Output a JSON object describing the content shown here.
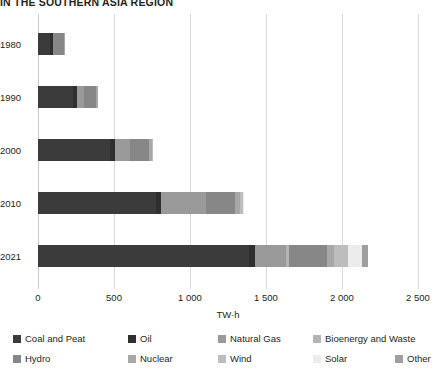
{
  "title": "IN THE SOUTHERN ASIA REGION",
  "axis": {
    "xlabel": "TW·h",
    "xticks": [
      "0",
      "500",
      "1 000",
      "1 500",
      "2 000",
      "2 500"
    ],
    "xlim": [
      0,
      2500
    ],
    "grid": true
  },
  "legend": {
    "position": "bottom",
    "entries": [
      {
        "label": "Coal and Peat",
        "color": "#3b3b3b"
      },
      {
        "label": "Oil",
        "color": "#2f2f2f"
      },
      {
        "label": "Natural Gas",
        "color": "#9a9a9a"
      },
      {
        "label": "Bioenergy and Waste",
        "color": "#b4b4b4"
      },
      {
        "label": "Hydro",
        "color": "#878787"
      },
      {
        "label": "Nuclear",
        "color": "#a8a8a8"
      },
      {
        "label": "Wind",
        "color": "#bdbdbd"
      },
      {
        "label": "Solar",
        "color": "#ececec"
      },
      {
        "label": "Other",
        "color": "#9f9f9f"
      }
    ]
  },
  "chart_data": {
    "type": "bar",
    "orientation": "horizontal",
    "stacked": true,
    "title": "IN THE SOUTHERN ASIA REGION",
    "xlabel": "TW·h",
    "ylabel": "",
    "xlim": [
      0,
      2500
    ],
    "categories": [
      "1980",
      "1990",
      "2000",
      "2010",
      "2021"
    ],
    "series": [
      {
        "name": "Coal and Peat",
        "color": "#3b3b3b",
        "values": [
          80,
          230,
          475,
          775,
          1390
        ]
      },
      {
        "name": "Oil",
        "color": "#2f2f2f",
        "values": [
          18,
          28,
          30,
          32,
          35
        ]
      },
      {
        "name": "Natural Gas",
        "color": "#9a9a9a",
        "values": [
          0,
          45,
          100,
          300,
          205
        ]
      },
      {
        "name": "Bioenergy and Waste",
        "color": "#b4b4b4",
        "values": [
          0,
          0,
          0,
          0,
          20
        ]
      },
      {
        "name": "Hydro",
        "color": "#878787",
        "values": [
          72,
          80,
          125,
          190,
          250
        ]
      },
      {
        "name": "Nuclear",
        "color": "#a8a8a8",
        "values": [
          3,
          10,
          18,
          30,
          50
        ]
      },
      {
        "name": "Wind",
        "color": "#bdbdbd",
        "values": [
          0,
          0,
          2,
          25,
          90
        ]
      },
      {
        "name": "Solar",
        "color": "#ececec",
        "values": [
          0,
          0,
          0,
          3,
          95
        ]
      },
      {
        "name": "Other",
        "color": "#9f9f9f",
        "values": [
          0,
          0,
          0,
          0,
          35
        ]
      }
    ],
    "totals": [
      173,
      393,
      750,
      1355,
      2170
    ]
  }
}
